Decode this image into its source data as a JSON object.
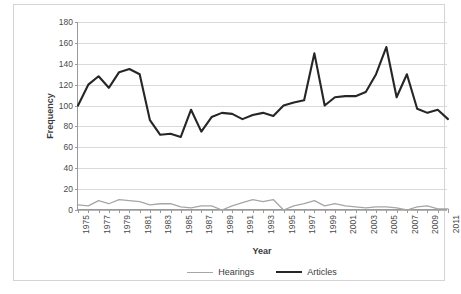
{
  "chart_data": {
    "type": "line",
    "title": "",
    "xlabel": "Year",
    "ylabel": "Frequency",
    "ylim": [
      0,
      180
    ],
    "ytick_step": 20,
    "yticks": [
      0,
      20,
      40,
      60,
      80,
      100,
      120,
      140,
      160,
      180
    ],
    "grid": true,
    "grid_axis": "y",
    "legend_position": "bottom",
    "x": [
      1975,
      1976,
      1977,
      1978,
      1979,
      1980,
      1981,
      1982,
      1983,
      1984,
      1985,
      1986,
      1987,
      1988,
      1989,
      1990,
      1991,
      1992,
      1993,
      1994,
      1995,
      1996,
      1997,
      1998,
      1999,
      2000,
      2001,
      2002,
      2003,
      2004,
      2005,
      2006,
      2007,
      2008,
      2009,
      2010,
      2011
    ],
    "xtick_labels": [
      "1975",
      "",
      "1977",
      "",
      "1979",
      "",
      "1981",
      "",
      "1983",
      "",
      "1985",
      "",
      "1987",
      "",
      "1989",
      "",
      "1991",
      "",
      "1993",
      "",
      "1995",
      "",
      "1997",
      "",
      "1999",
      "",
      "2001",
      "",
      "2003",
      "",
      "2005",
      "",
      "2007",
      "",
      "2009",
      "",
      "2011"
    ],
    "xtick_labels_all": [
      "1975",
      "1976",
      "1977",
      "1978",
      "1979",
      "1980",
      "1981",
      "1982",
      "1983",
      "1984",
      "1985",
      "1986",
      "1987",
      "1988",
      "1989",
      "1990",
      "1991",
      "1992",
      "1993",
      "1994",
      "1995",
      "1996",
      "1997",
      "1998",
      "1999",
      "2000",
      "2001",
      "2002",
      "2003",
      "2004",
      "2005",
      "2006",
      "2007",
      "2008",
      "2009",
      "2010",
      "2011"
    ],
    "xtick_rotation": -90,
    "series": [
      {
        "name": "Hearings",
        "color": "#a6a6a6",
        "width": 1.3,
        "values": [
          5,
          4,
          9,
          6,
          10,
          9,
          8,
          5,
          6,
          6,
          3,
          2,
          4,
          4,
          0,
          4,
          7,
          10,
          8,
          10,
          0,
          4,
          6,
          9,
          4,
          6,
          4,
          3,
          2,
          3,
          3,
          2,
          0,
          3,
          4,
          1,
          1
        ]
      },
      {
        "name": "Articles",
        "color": "#262626",
        "width": 2.1,
        "values": [
          100,
          120,
          128,
          117,
          132,
          135,
          130,
          86,
          72,
          73,
          70,
          96,
          75,
          89,
          93,
          92,
          87,
          91,
          93,
          90,
          100,
          103,
          105,
          150,
          100,
          108,
          109,
          109,
          113,
          130,
          156,
          108,
          130,
          97,
          93,
          96,
          87
        ]
      }
    ]
  },
  "articles_by_year": {
    "1975": 100,
    "1976": 120,
    "1977": 128,
    "1978": 117,
    "1979": 132,
    "1980": 135,
    "1981": 130,
    "1982": 86,
    "1983": 72,
    "1984": 73,
    "1985": 70,
    "1986": 96,
    "1987": 75,
    "1988": 89,
    "1989": 93,
    "1990": 92,
    "1991": 87,
    "1992": 91,
    "1993": 93,
    "1994": 90,
    "1995": 100,
    "1996": 103,
    "1997": 105,
    "1998": 150,
    "1999": 100,
    "2000": 108,
    "2001": 109,
    "2002": 109,
    "2003": 113,
    "2004": 130,
    "2005": 156,
    "2006": 108,
    "2007": 130,
    "2008": 97,
    "2009": 93,
    "2010": 96,
    "2011": 87
  },
  "legend": {
    "items": [
      {
        "label": "Hearings",
        "color": "#a6a6a6"
      },
      {
        "label": "Articles",
        "color": "#262626"
      }
    ]
  },
  "axes": {
    "y_title": "Frequency",
    "x_title": "Year"
  }
}
